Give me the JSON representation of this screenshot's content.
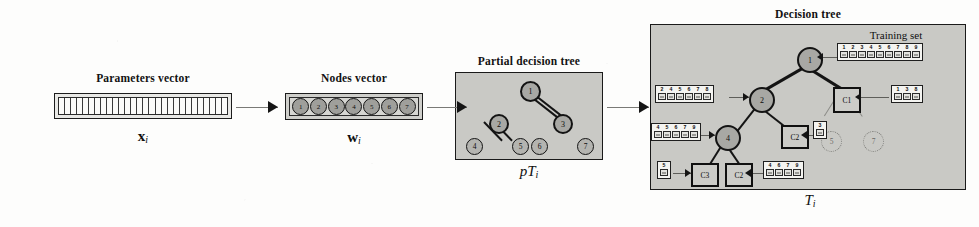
{
  "diagram": {
    "title_params": "Parameters vector",
    "title_nodes": "Nodes vector",
    "title_ptree": "Partial decision tree",
    "title_dtree": "Decision tree",
    "title_trainingset": "Training set",
    "caption_params": "x",
    "caption_params_sub": "i",
    "caption_nodes": "w",
    "caption_nodes_sub": "i",
    "caption_ptree": "pT",
    "caption_ptree_sub": "i",
    "caption_dtree": "T",
    "caption_dtree_sub": "i"
  },
  "parameters_vector": {
    "cell_count": 28
  },
  "nodes_vector": {
    "nodes": [
      "1",
      "2",
      "3",
      "4",
      "5",
      "6",
      "7"
    ]
  },
  "partial_tree": {
    "nodes": [
      {
        "id": "root",
        "label": "1"
      },
      {
        "id": "n2",
        "label": "2"
      },
      {
        "id": "n3",
        "label": "3"
      },
      {
        "id": "n4",
        "label": "4"
      },
      {
        "id": "n5",
        "label": "5"
      },
      {
        "id": "n6",
        "label": "6"
      },
      {
        "id": "n7",
        "label": "7"
      }
    ]
  },
  "decision_tree": {
    "nodes": [
      {
        "id": "d1",
        "label": "1",
        "kind": "internal"
      },
      {
        "id": "d2",
        "label": "2",
        "kind": "internal"
      },
      {
        "id": "d4",
        "label": "4",
        "kind": "internal"
      },
      {
        "id": "c1",
        "label": "C1",
        "kind": "class"
      },
      {
        "id": "c2a",
        "label": "C2",
        "kind": "class"
      },
      {
        "id": "c3",
        "label": "C3",
        "kind": "class"
      },
      {
        "id": "c2b",
        "label": "C2",
        "kind": "class"
      },
      {
        "id": "p5",
        "label": "5",
        "kind": "pruned"
      },
      {
        "id": "p7",
        "label": "7",
        "kind": "pruned"
      }
    ],
    "sets": [
      {
        "id": "set-root",
        "items": [
          "1",
          "2",
          "3",
          "4",
          "5",
          "6",
          "7",
          "8",
          "9"
        ]
      },
      {
        "id": "set-n2",
        "items": [
          "2",
          "4",
          "5",
          "6",
          "7",
          "8"
        ]
      },
      {
        "id": "set-c1",
        "items": [
          "1",
          "3",
          "8"
        ]
      },
      {
        "id": "set-n4",
        "items": [
          "4",
          "5",
          "6",
          "7",
          "9"
        ]
      },
      {
        "id": "set-c2a",
        "items": [
          "3"
        ]
      },
      {
        "id": "set-c3",
        "items": [
          "5"
        ]
      },
      {
        "id": "set-c2b",
        "items": [
          "4",
          "6",
          "7",
          "9"
        ]
      }
    ]
  }
}
